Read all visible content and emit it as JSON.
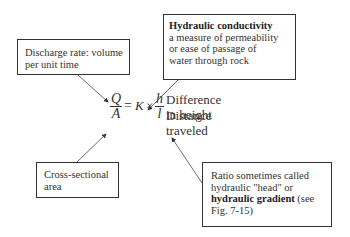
{
  "boxes": {
    "discharge": {
      "lines": [
        "Discharge rate: volume",
        "per unit time"
      ]
    },
    "conductivity": {
      "title": "Hydraulic conductivity",
      "lines": [
        "a measure of permeability",
        "or ease of passage of",
        "water through rock"
      ]
    },
    "area": {
      "lines": [
        "Cross-sectional",
        "area"
      ]
    },
    "ratio": {
      "line1": "Ratio sometimes called",
      "line2": "hydraulic \"head\" or",
      "bold": "hydraulic gradient",
      "line3_tail": " (see",
      "line4": "Fig. 7-15)"
    }
  },
  "equation": {
    "lhs_num": "Q",
    "lhs_den": "A",
    "equals": "=",
    "k": "K",
    "times": "×",
    "rhs_num": "h",
    "rhs_den": "l",
    "num_label": "Difference in height",
    "den_label": "Distance traveled"
  },
  "colors": {
    "stroke": "#333333",
    "background": "#ffffff"
  }
}
